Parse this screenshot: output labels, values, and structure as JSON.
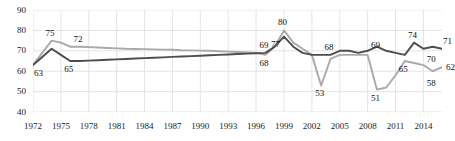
{
  "chart_data": {
    "type": "line",
    "title": "",
    "subtitle": "",
    "xlabel": "",
    "ylabel": "",
    "ylim": [
      40,
      90
    ],
    "yticks": [
      40,
      50,
      60,
      70,
      80,
      90
    ],
    "xlim": [
      1972,
      2016
    ],
    "xticks": [
      1972,
      1975,
      1978,
      1981,
      1984,
      1987,
      1990,
      1993,
      1996,
      1999,
      2002,
      2005,
      2008,
      2011,
      2014
    ],
    "grid": true,
    "legend": "none",
    "x": [
      1972,
      1973,
      1974,
      1975,
      1976,
      1977,
      1978,
      1979,
      1980,
      1981,
      1982,
      1983,
      1984,
      1985,
      1986,
      1987,
      1988,
      1989,
      1990,
      1991,
      1992,
      1993,
      1994,
      1995,
      1996,
      1997,
      1998,
      1999,
      2000,
      2001,
      2002,
      2003,
      2004,
      2005,
      2006,
      2007,
      2008,
      2009,
      2010,
      2011,
      2012,
      2013,
      2014,
      2015,
      2016
    ],
    "series": [
      {
        "name": "light-gray-series",
        "color": "#a9a9a9",
        "values": [
          63,
          69,
          75,
          74,
          72,
          72,
          71.8,
          71.6,
          71.4,
          71.2,
          71,
          70.9,
          70.8,
          70.7,
          70.6,
          70.5,
          70.3,
          70.2,
          70.1,
          70,
          69.8,
          69.6,
          69.4,
          69.2,
          69,
          68,
          72,
          80,
          74,
          71,
          68,
          53,
          66,
          68,
          68,
          68,
          68,
          51,
          52,
          58,
          65,
          64,
          63,
          60,
          62
        ]
      },
      {
        "name": "dark-gray-series",
        "color": "#4d4d4d",
        "values": [
          63,
          67,
          71,
          68,
          65,
          65,
          65.2,
          65.4,
          65.6,
          65.8,
          66,
          66.2,
          66.4,
          66.6,
          66.8,
          67,
          67.2,
          67.4,
          67.6,
          67.8,
          68,
          68.2,
          68.4,
          68.6,
          68.8,
          69,
          72,
          77,
          72,
          69,
          68,
          68,
          68,
          70,
          70,
          69,
          70,
          72,
          70,
          69,
          68,
          74,
          71,
          72,
          71
        ]
      }
    ],
    "point_labels": [
      {
        "text": "63",
        "x": 1972,
        "value": 63,
        "series": "light-gray-series",
        "pos": "below-right"
      },
      {
        "text": "75",
        "x": 1974,
        "value": 75,
        "series": "light-gray-series",
        "pos": "above"
      },
      {
        "text": "72",
        "x": 1977,
        "value": 72,
        "series": "light-gray-series",
        "pos": "above"
      },
      {
        "text": "65",
        "x": 1976,
        "value": 65,
        "series": "dark-gray-series",
        "pos": "below"
      },
      {
        "text": "69",
        "x": 1997,
        "value": 69,
        "series": "dark-gray-series",
        "pos": "above"
      },
      {
        "text": "68",
        "x": 1997,
        "value": 68,
        "series": "light-gray-series",
        "pos": "below"
      },
      {
        "text": "80",
        "x": 1999,
        "value": 80,
        "series": "light-gray-series",
        "pos": "above"
      },
      {
        "text": "77",
        "x": 1999,
        "value": 77,
        "series": "dark-gray-series",
        "pos": "below-left"
      },
      {
        "text": "53",
        "x": 2003,
        "value": 53,
        "series": "light-gray-series",
        "pos": "below"
      },
      {
        "text": "68",
        "x": 2004,
        "value": 68,
        "series": "dark-gray-series",
        "pos": "above"
      },
      {
        "text": "69",
        "x": 2009,
        "value": 69,
        "series": "dark-gray-series",
        "pos": "above"
      },
      {
        "text": "51",
        "x": 2009,
        "value": 51,
        "series": "light-gray-series",
        "pos": "below"
      },
      {
        "text": "74",
        "x": 2013,
        "value": 74,
        "series": "dark-gray-series",
        "pos": "above"
      },
      {
        "text": "65",
        "x": 2012,
        "value": 65,
        "series": "light-gray-series",
        "pos": "below"
      },
      {
        "text": "71",
        "x": 2016,
        "value": 71,
        "series": "dark-gray-series",
        "pos": "above-right"
      },
      {
        "text": "70",
        "x": 2015,
        "value": 70,
        "series": "dark-gray-series",
        "pos": "below"
      },
      {
        "text": "58",
        "x": 2015,
        "value": 58,
        "series": "light-gray-series",
        "pos": "below"
      },
      {
        "text": "62",
        "x": 2016,
        "value": 62,
        "series": "light-gray-series",
        "pos": "right"
      }
    ],
    "colors": {
      "light_series": "#a9a9a9",
      "dark_series": "#4d4d4d",
      "grid": "#e4e4e4",
      "axis_text": "#1a1a1a",
      "background": "#ffffff"
    }
  }
}
